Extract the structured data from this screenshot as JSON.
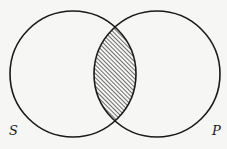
{
  "diagram": {
    "type": "venn",
    "background": "#f6f6f4",
    "stroke_color": "#1a1a1a",
    "hatch_color": "#333333",
    "sets": [
      {
        "id": "S",
        "label": "S",
        "cx": 73,
        "cy": 74,
        "r": 63,
        "label_x": 9,
        "label_y": 135
      },
      {
        "id": "P",
        "label": "P",
        "cx": 157,
        "cy": 74,
        "r": 63,
        "label_x": 212,
        "label_y": 135
      }
    ],
    "shaded_region": "S ∩ P",
    "shading_style": "diagonal-hatch"
  }
}
